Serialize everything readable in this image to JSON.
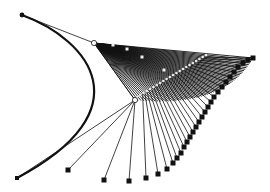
{
  "diagram": {
    "type": "bezier-construction",
    "colors": {
      "background": "#ffffff",
      "stroke": "#111111",
      "highlight": "#e8e8e8"
    },
    "start_point": [
      22,
      15
    ],
    "end_point": [
      17,
      178
    ],
    "control_points": [
      [
        94,
        43
      ],
      [
        135,
        100
      ]
    ],
    "main_curve": {
      "from": [
        22,
        15
      ],
      "c1": [
        90,
        40
      ],
      "c2": [
        145,
        110
      ],
      "to": [
        17,
        178
      ]
    },
    "fan_top": {
      "apex": [
        94,
        43
      ],
      "targets_start": [
        135,
        100
      ],
      "targets_end": [
        253,
        58
      ],
      "count": 60
    },
    "highlight_dots": {
      "from": [
        137,
        97
      ],
      "to": [
        206,
        55
      ],
      "count": 22
    },
    "scattered_dots": [
      [
        113,
        45
      ],
      [
        127,
        49
      ],
      [
        142,
        57
      ],
      [
        164,
        70
      ]
    ],
    "bottom_squares": [
      [
        68,
        170
      ],
      [
        104,
        180
      ],
      [
        129,
        181
      ],
      [
        146,
        178
      ],
      [
        158,
        174
      ],
      [
        167,
        169
      ],
      [
        173,
        163
      ],
      [
        177,
        158
      ],
      [
        181,
        153
      ],
      [
        184,
        147
      ],
      [
        187,
        142
      ],
      [
        190,
        137
      ],
      [
        193,
        132
      ],
      [
        196,
        127
      ],
      [
        199,
        122
      ],
      [
        202,
        117
      ],
      [
        205,
        112
      ],
      [
        208,
        107
      ],
      [
        211,
        102
      ],
      [
        214,
        97
      ],
      [
        218,
        92
      ],
      [
        222,
        87
      ],
      [
        226,
        82
      ],
      [
        230,
        77
      ],
      [
        234,
        72
      ],
      [
        238,
        67
      ],
      [
        243,
        63
      ],
      [
        248,
        60
      ],
      [
        253,
        58
      ]
    ]
  }
}
